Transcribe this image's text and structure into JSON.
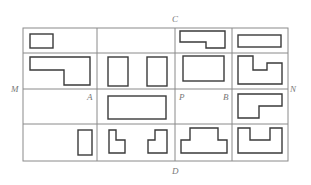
{
  "figure": {
    "type": "grid of orthographic view shapes",
    "labels": {
      "C": "C",
      "D": "D",
      "M": "M",
      "N": "N",
      "A": "A",
      "B": "B",
      "P": "P"
    },
    "grid": {
      "columns": 4,
      "rows": 4,
      "x_lines": [
        23,
        97,
        175,
        232,
        288
      ],
      "y_lines": [
        28,
        53,
        89,
        124,
        161
      ]
    },
    "cells": [
      {
        "row": 0,
        "col": 0,
        "shapes": [
          "small rectangle"
        ]
      },
      {
        "row": 0,
        "col": 1,
        "shapes": []
      },
      {
        "row": 0,
        "col": 2,
        "shapes": [
          "stepped bar (L, notch bottom-left)"
        ]
      },
      {
        "row": 0,
        "col": 3,
        "shapes": [
          "long thin rectangle"
        ]
      },
      {
        "row": 1,
        "col": 0,
        "shapes": [
          "stepped L shape"
        ]
      },
      {
        "row": 1,
        "col": 1,
        "shapes": [
          "tall rectangle",
          "tall rectangle"
        ]
      },
      {
        "row": 1,
        "col": 2,
        "shapes": [
          "rectangle"
        ]
      },
      {
        "row": 1,
        "col": 3,
        "shapes": [
          "notched rectangle (top)"
        ]
      },
      {
        "row": 2,
        "col": 0,
        "shapes": []
      },
      {
        "row": 2,
        "col": 1,
        "shapes": [
          "wide rectangle"
        ]
      },
      {
        "row": 2,
        "col": 2,
        "shapes": []
      },
      {
        "row": 2,
        "col": 3,
        "shapes": [
          "L shape (step top-right)"
        ]
      },
      {
        "row": 3,
        "col": 0,
        "shapes": [
          "narrow tall rectangle"
        ]
      },
      {
        "row": 3,
        "col": 1,
        "shapes": [
          "L shape",
          "mirrored L shape"
        ]
      },
      {
        "row": 3,
        "col": 2,
        "shapes": [
          "inverted T / stepped base"
        ]
      },
      {
        "row": 3,
        "col": 3,
        "shapes": [
          "U shape"
        ]
      }
    ]
  }
}
